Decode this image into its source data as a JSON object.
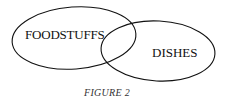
{
  "diagram": {
    "type": "venn",
    "sets": [
      {
        "label": "FOODSTUFFS"
      },
      {
        "label": "DISHES"
      }
    ],
    "caption": "FIGURE 2"
  }
}
